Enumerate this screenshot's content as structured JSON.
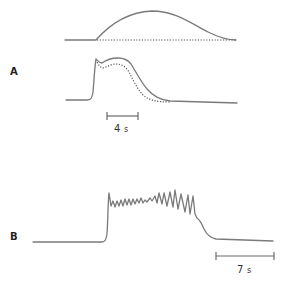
{
  "figure": {
    "panels": [
      {
        "id": "A",
        "label": "A",
        "traces": [
          {
            "name": "stimulus-trace",
            "style": "solid",
            "description": "Smooth bell-shaped rise and fall"
          },
          {
            "name": "stimulus-baseline",
            "style": "dotted",
            "description": "Flat dotted baseline under stimulus"
          },
          {
            "name": "response-trace",
            "style": "solid",
            "description": "Rapid rise with initial spike, plateau, then decay to baseline"
          },
          {
            "name": "response-trace-alt",
            "style": "dotted",
            "description": "Dotted response slightly lower and decaying earlier"
          }
        ],
        "scale_bar": {
          "value": "4",
          "unit": "s"
        }
      },
      {
        "id": "B",
        "label": "B",
        "traces": [
          {
            "name": "oscillating-trace",
            "style": "solid",
            "description": "Sharp rise to plateau with oscillations growing in amplitude, then decay to baseline"
          }
        ],
        "scale_bar": {
          "value": "7",
          "unit": "s"
        }
      }
    ],
    "colors": {
      "trace": "#7a7a7a",
      "text": "#222222"
    }
  }
}
